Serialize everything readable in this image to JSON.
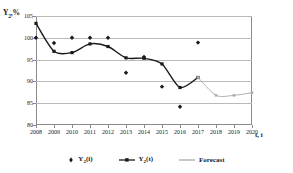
{
  "chart_data": {
    "type": "line",
    "title": "",
    "xlabel": "t, i",
    "ylabel": "Y2,%",
    "ylabel_main": "Y",
    "ylabel_sub": "2",
    "ylabel_suffix": ",%",
    "ylim": [
      80,
      105
    ],
    "yticks": [
      105,
      100,
      95,
      90,
      85,
      80
    ],
    "grid": true,
    "legend_position": "bottom-center",
    "categories": [
      2008,
      2009,
      2010,
      2011,
      2012,
      2013,
      2014,
      2015,
      2016,
      2017,
      2018,
      2019,
      2020
    ],
    "xticks": [
      "2008",
      "2009",
      "2010",
      "2011",
      "2012",
      "2013",
      "2014",
      "2015",
      "2016",
      "2017",
      "2018",
      "2019",
      "2020"
    ],
    "series": [
      {
        "name": "Y2(i)",
        "name_main": "Y",
        "name_sub": "2",
        "name_suffix": "(i)",
        "type": "scatter",
        "marker": "diamond",
        "color": "#1a1a1a",
        "x": [
          2008,
          2009,
          2010,
          2011,
          2012,
          2013,
          2014,
          2015,
          2016,
          2017
        ],
        "values": [
          100.0,
          98.8,
          100.0,
          100.0,
          100.0,
          92.0,
          95.6,
          88.8,
          84.2,
          98.9
        ]
      },
      {
        "name": "Y2(t)",
        "name_main": "Y",
        "name_sub": "2",
        "name_suffix": "(t)",
        "type": "line",
        "marker": "square",
        "color": "#1a1a1a",
        "x": [
          2008,
          2009,
          2010,
          2011,
          2012,
          2013,
          2014,
          2015,
          2016,
          2017
        ],
        "values": [
          103.3,
          96.9,
          96.6,
          98.6,
          98.0,
          95.4,
          95.3,
          94.0,
          88.6,
          90.9
        ]
      },
      {
        "name": "Forecast",
        "type": "line",
        "marker": "square",
        "color": "#b0b0b0",
        "x": [
          2017,
          2018,
          2019,
          2020
        ],
        "values": [
          90.9,
          86.8,
          86.8,
          87.4
        ]
      }
    ]
  },
  "legend": {
    "items": [
      {
        "label": "Y2(i)",
        "main": "Y",
        "sub": "2",
        "suffix": "(i)",
        "style": "marker-only",
        "color": "#1a1a1a"
      },
      {
        "label": "Y2(t)",
        "main": "Y",
        "sub": "2",
        "suffix": "(t)",
        "style": "line-marker",
        "color": "#1a1a1a"
      },
      {
        "label": "Forecast",
        "main": "Forecast",
        "sub": "",
        "suffix": "",
        "style": "line",
        "color": "#b0b0b0"
      }
    ]
  }
}
